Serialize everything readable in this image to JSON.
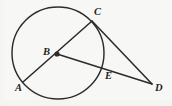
{
  "figure": {
    "kind": "circle-geometry-diagram",
    "background_color": "#f7f7f6",
    "stroke_color": "#2b2a28",
    "label_color": "#1f1e1c",
    "width": 172,
    "height": 106,
    "circle": {
      "cx": 58,
      "cy": 53,
      "r": 46
    },
    "center_point": {
      "name": "B",
      "x": 57,
      "y": 54
    },
    "points": [
      {
        "id": "A",
        "label": "A",
        "x": 23,
        "y": 82,
        "label_x": 15,
        "label_y": 83,
        "on_circle": true
      },
      {
        "id": "B",
        "label": "B",
        "x": 57,
        "y": 54,
        "label_x": 43,
        "label_y": 47,
        "on_circle": false
      },
      {
        "id": "C",
        "label": "C",
        "x": 92,
        "y": 21,
        "label_x": 94,
        "label_y": 7,
        "on_circle": true
      },
      {
        "id": "D",
        "label": "D",
        "x": 152,
        "y": 84,
        "label_x": 155,
        "label_y": 83,
        "on_circle": false
      },
      {
        "id": "E",
        "label": "E",
        "x": 103,
        "y": 70,
        "label_x": 105,
        "label_y": 71,
        "on_circle": true
      }
    ],
    "segments": [
      {
        "id": "AC",
        "from": "A",
        "to": "C",
        "through": "B",
        "note": "diameter through center B"
      },
      {
        "id": "BD",
        "from": "B",
        "to": "D",
        "through": "E",
        "note": "secant from center through E to D"
      },
      {
        "id": "CD",
        "from": "C",
        "to": "D",
        "note": "tangent-like segment from C to D"
      }
    ]
  }
}
